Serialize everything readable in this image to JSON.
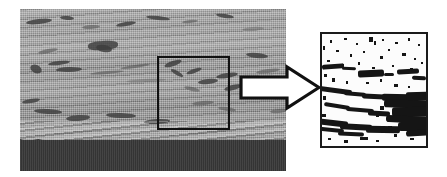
{
  "figure": {
    "background_color": "#ffffff",
    "width": 447,
    "height": 177
  },
  "panels": [
    {
      "id": "micrograph",
      "label": "cross-section-micrograph",
      "description": "Greyscale SEM cross-section of a thermal-spray coating on a dark substrate",
      "x": 20,
      "y": 9,
      "width": 266,
      "height": 162,
      "layers": [
        {
          "name": "coating",
          "color": "#a3a3a3",
          "description": "light grey lamellar coating with dark elongated pores"
        },
        {
          "name": "substrate",
          "color": "#3a3a3a",
          "description": "dark uniform substrate band at the bottom"
        },
        {
          "name": "interface",
          "description": "wavy rough boundary between coating and substrate"
        }
      ]
    },
    {
      "id": "roi-box",
      "label": "region-of-interest-box",
      "description": "Black square outline marking the magnified region",
      "x": 157,
      "y": 56,
      "width": 73,
      "height": 74,
      "stroke_color": "#111111",
      "stroke_width": 2
    },
    {
      "id": "arrow",
      "label": "pointer-arrow",
      "description": "Outlined block arrow pointing right from the ROI box to the binary image",
      "x": 239,
      "y": 64,
      "width": 82,
      "height": 47,
      "fill_color": "#ffffff",
      "stroke_color": "#111111"
    },
    {
      "id": "binary-image",
      "label": "binarised-roi",
      "description": "Thresholded black-and-white image of the region of interest showing pores as black features on a white matrix",
      "x": 320,
      "y": 32,
      "width": 108,
      "height": 116,
      "background_color": "#fcfcfc",
      "feature_color": "#151515",
      "stroke_color": "#1a1a1a",
      "stroke_width": 2
    }
  ],
  "colors": {
    "page_background": "#ffffff",
    "coating_grey": "#a3a3a3",
    "substrate_dark": "#3a3a3a",
    "outline_black": "#111111",
    "binary_white": "#fcfcfc",
    "binary_black": "#151515"
  }
}
